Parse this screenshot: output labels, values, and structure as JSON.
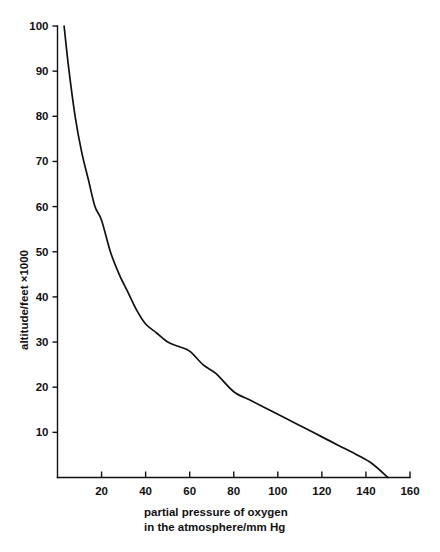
{
  "chart_data": {
    "type": "line",
    "title": "",
    "xlabel_line1": "partial pressure of oxygen",
    "xlabel_line2": "in the atmosphere/mm Hg",
    "ylabel": "altitude/feet  ×1000",
    "xlim": [
      0,
      160
    ],
    "ylim": [
      0,
      100
    ],
    "grid": false,
    "legend": "none",
    "xticks": [
      20,
      40,
      60,
      80,
      100,
      120,
      140,
      160
    ],
    "xtick_labels": [
      "20",
      "40",
      "60",
      "80",
      "100",
      "120",
      "140",
      "160"
    ],
    "yticks": [
      10,
      20,
      30,
      40,
      50,
      60,
      70,
      80,
      90,
      100
    ],
    "ytick_labels": [
      "10",
      "20",
      "30",
      "40",
      "50",
      "60",
      "70",
      "80",
      "90",
      "100"
    ],
    "series": [
      {
        "name": "altitude vs partial pressure of oxygen",
        "x": [
          3,
          5,
          8,
          11,
          14,
          17,
          20,
          24,
          28,
          32,
          36,
          40,
          45,
          50,
          55,
          60,
          66,
          72,
          80,
          88,
          96,
          104,
          112,
          120,
          128,
          136,
          143,
          150
        ],
        "y": [
          100,
          91,
          80,
          72,
          66,
          60,
          57,
          50,
          45,
          41,
          37,
          34,
          32,
          30,
          29,
          28,
          25,
          23,
          19,
          17,
          15,
          13,
          11,
          9,
          7,
          5,
          3,
          0
        ]
      }
    ],
    "annotations": []
  }
}
